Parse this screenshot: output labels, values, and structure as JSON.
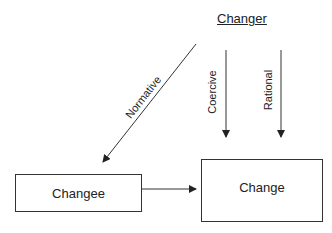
{
  "diagram": {
    "source_label": "Changer",
    "arrows": [
      {
        "id": "normative",
        "label": "Normative"
      },
      {
        "id": "coercive",
        "label": "Coercive"
      },
      {
        "id": "rational",
        "label": "Rational"
      }
    ],
    "boxes": {
      "changee": "Changee",
      "change": "Change"
    }
  }
}
